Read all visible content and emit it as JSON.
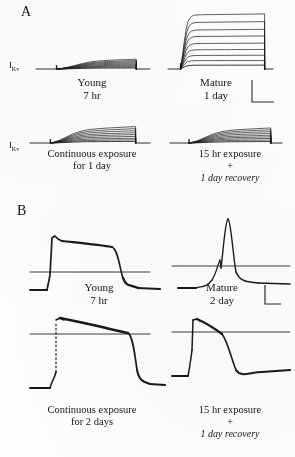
{
  "figure": {
    "background_color": "#fdfdfc",
    "ink_color": "#1a1a1a",
    "panels": [
      {
        "letter": "A",
        "measurement_label": "I",
        "measurement_subscript": "Kv",
        "recordings": [
          {
            "position": "top-left",
            "line1": "Young",
            "line2": "7 hr"
          },
          {
            "position": "top-right",
            "line1": "Mature",
            "line2": "1 day"
          },
          {
            "position": "bottom-left",
            "line1": "Continuous exposure",
            "line2": "for 1 day"
          },
          {
            "position": "bottom-right",
            "line1": "15 hr exposure",
            "plus": "+",
            "line3": "1 day recovery"
          }
        ]
      },
      {
        "letter": "B",
        "recordings": [
          {
            "position": "top-left",
            "line1": "Young",
            "line2": "7 hr"
          },
          {
            "position": "top-right",
            "line1": "Mature",
            "line2": "2 day"
          },
          {
            "position": "bottom-left",
            "line1": "Continuous exposure",
            "line2": "for 2 days"
          },
          {
            "position": "bottom-right",
            "line1": "15 hr exposure",
            "plus": "+",
            "line3": "1 day recovery"
          }
        ]
      }
    ]
  },
  "chart_data": {
    "type": "line",
    "title": "",
    "xlabel": "time",
    "ylabel": "current / membrane potential",
    "grid": false,
    "legend": "none",
    "panels": [
      {
        "panel": "A",
        "type": "line",
        "signal": "IKv",
        "ylabel": "IKv",
        "axis_style": "baseline with leader tick at left",
        "subplots": [
          {
            "name": "Young 7 hr",
            "label_lines": [
              "Young",
              "7 hr"
            ],
            "n_traces": 9,
            "peak_relative_amplitude": 0.22,
            "activation": "slow sigmoid ramp",
            "step_start_fraction": 0.18,
            "step_end_fraction": 0.88,
            "trace_peaks_relative": [
              0.22,
              0.19,
              0.165,
              0.14,
              0.115,
              0.09,
              0.068,
              0.045,
              0.024
            ]
          },
          {
            "name": "Mature 1 day",
            "label_lines": [
              "Mature",
              "1 day"
            ],
            "n_traces": 9,
            "peak_relative_amplitude": 1.0,
            "activation": "fast rise to sustained plateau",
            "step_start_fraction": 0.12,
            "step_end_fraction": 0.92,
            "trace_peaks_relative": [
              1.0,
              0.86,
              0.72,
              0.6,
              0.47,
              0.355,
              0.25,
              0.155,
              0.07
            ]
          },
          {
            "name": "Continuous exposure for 1 day",
            "label_lines": [
              "Continuous exposure",
              "for 1 day"
            ],
            "n_traces": 9,
            "peak_relative_amplitude": 0.36,
            "activation": "slow ramp, slightly larger than young",
            "step_start_fraction": 0.17,
            "step_end_fraction": 0.88,
            "trace_peaks_relative": [
              0.36,
              0.315,
              0.27,
              0.225,
              0.185,
              0.145,
              0.105,
              0.07,
              0.035
            ]
          },
          {
            "name": "15 hr exposure + 1 day recovery",
            "label_lines": [
              "15 hr exposure",
              "+",
              "1 day recovery"
            ],
            "n_traces": 9,
            "peak_relative_amplitude": 0.33,
            "activation": "slow ramp",
            "step_start_fraction": 0.17,
            "step_end_fraction": 0.9,
            "trace_peaks_relative": [
              0.33,
              0.29,
              0.25,
              0.21,
              0.17,
              0.135,
              0.1,
              0.065,
              0.032
            ]
          }
        ],
        "scale_bar": {
          "shape": "L",
          "x_label": "",
          "y_label": ""
        }
      },
      {
        "panel": "B",
        "type": "line",
        "signal": "membrane potential",
        "ylabel": "Vm",
        "axis_style": "zero-potential reference line across trace",
        "subplots": [
          {
            "name": "Young 7 hr",
            "label_lines": [
              "Young",
              "7 hr"
            ],
            "waveform": "fast upstroke, small overshoot notch, long flat plateau, abrupt repolarization",
            "overshoot": true,
            "plateau_duration_relative": 0.58,
            "repolarization": "steep"
          },
          {
            "name": "Mature 2 day",
            "label_lines": [
              "Mature",
              "2 day"
            ],
            "waveform": "slow depolarizing ramp then narrow spike with notch, rapid decay",
            "overshoot": true,
            "plateau_duration_relative": 0.05,
            "repolarization": "rapid"
          },
          {
            "name": "Continuous exposure for 2 days",
            "label_lines": [
              "Continuous exposure",
              "for 2 days"
            ],
            "waveform": "truncated (dotted) upstroke, long plateau with slow decline, steep repolarization",
            "overshoot": true,
            "dotted_upstroke": true,
            "plateau_duration_relative": 0.6,
            "repolarization": "steep"
          },
          {
            "name": "15 hr exposure + 1 day recovery",
            "label_lines": [
              "15 hr exposure",
              "+",
              "1 day recovery"
            ],
            "waveform": "fast upstroke, short plateau, early steep repolarization",
            "overshoot": true,
            "plateau_duration_relative": 0.22,
            "repolarization": "steep"
          }
        ],
        "scale_bar": {
          "shape": "L",
          "x_label": "",
          "y_label": ""
        }
      }
    ]
  }
}
